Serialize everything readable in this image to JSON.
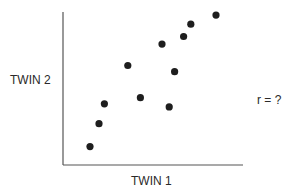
{
  "chart_data": {
    "type": "scatter",
    "title": "",
    "xlabel": "TWIN 1",
    "ylabel": "TWIN 2",
    "annotation": "r = ?",
    "xlim": [
      0,
      10
    ],
    "ylim": [
      0,
      10
    ],
    "grid": false,
    "ticks": false,
    "legend": null,
    "series": [
      {
        "name": "twins",
        "color": "#1e1e1e",
        "points": [
          {
            "x": 1.5,
            "y": 1.2
          },
          {
            "x": 2.0,
            "y": 2.7
          },
          {
            "x": 2.3,
            "y": 4.0
          },
          {
            "x": 3.6,
            "y": 6.5
          },
          {
            "x": 4.3,
            "y": 4.4
          },
          {
            "x": 5.5,
            "y": 7.9
          },
          {
            "x": 5.9,
            "y": 3.8
          },
          {
            "x": 6.2,
            "y": 6.1
          },
          {
            "x": 6.7,
            "y": 8.4
          },
          {
            "x": 7.1,
            "y": 9.2
          },
          {
            "x": 8.5,
            "y": 9.8
          }
        ]
      }
    ]
  },
  "layout": {
    "axis_color": "#555555",
    "plot": {
      "left": 63,
      "right": 243,
      "top": 12,
      "bottom": 165
    }
  }
}
